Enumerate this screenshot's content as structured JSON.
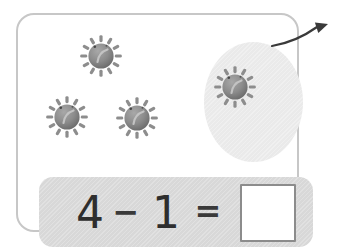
{
  "problem": {
    "minuend": "4",
    "operator": "−",
    "subtrahend": "1",
    "equals_sign": "=",
    "answer_value": ""
  },
  "scene": {
    "item_icon": "sun-icon",
    "total_count": 4,
    "taken_away_count": 1,
    "suns": [
      {
        "x": 101,
        "y": 56,
        "taken_away": false
      },
      {
        "x": 67,
        "y": 117,
        "taken_away": false
      },
      {
        "x": 137,
        "y": 118,
        "taken_away": false
      },
      {
        "x": 235,
        "y": 87,
        "taken_away": true
      }
    ]
  },
  "colors": {
    "card_border": "#c7c7c7",
    "band_background": "#d8d8d8",
    "oval_background": "#eaeaea",
    "sun_body": "#8a8a8a",
    "sun_smile": "#c3c3c3",
    "equation_text": "#2e2e2e",
    "arrow": "#3a3a3a",
    "answer_box_border": "#8c8c8c"
  }
}
